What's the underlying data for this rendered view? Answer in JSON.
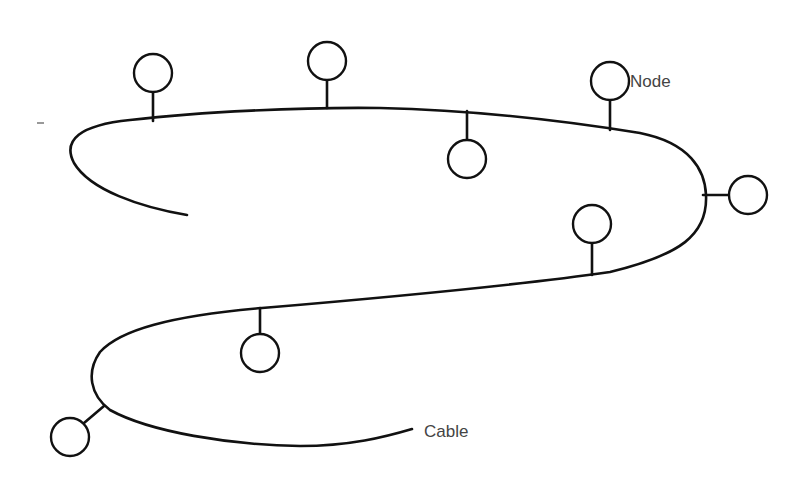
{
  "diagram": {
    "type": "bus-network-topology",
    "labels": {
      "node": "Node",
      "cable": "Cable"
    },
    "colors": {
      "line": "#111111",
      "label_text": "#444444",
      "background": "#ffffff"
    },
    "nodes": [
      {
        "id": "node-1",
        "cx": 153,
        "cy": 73
      },
      {
        "id": "node-2",
        "cx": 327,
        "cy": 61
      },
      {
        "id": "node-3",
        "cx": 467,
        "cy": 159
      },
      {
        "id": "node-4",
        "cx": 610,
        "cy": 81,
        "label": "Node"
      },
      {
        "id": "node-5",
        "cx": 748,
        "cy": 195
      },
      {
        "id": "node-6",
        "cx": 592,
        "cy": 224
      },
      {
        "id": "node-7",
        "cx": 260,
        "cy": 353
      },
      {
        "id": "node-8",
        "cx": 70,
        "cy": 437
      }
    ]
  }
}
